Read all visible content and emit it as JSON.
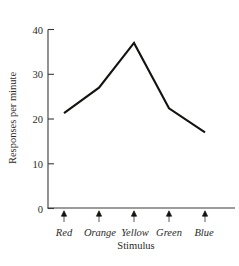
{
  "chart_data": {
    "type": "line",
    "title": "",
    "subtitle": "",
    "xlabel": "Stimulus",
    "ylabel": "Responses per minute",
    "categories": [
      "Red",
      "Orange",
      "Yellow",
      "Green",
      "Blue"
    ],
    "values": [
      21.3,
      27.0,
      37.0,
      22.4,
      17.0
    ],
    "series": [
      {
        "name": "Responses per minute",
        "values": [
          21.3,
          27.0,
          37.0,
          22.4,
          17.0
        ],
        "color": "#15130f"
      }
    ],
    "ylim": [
      0,
      40
    ],
    "yticks": [
      0,
      10,
      20,
      30,
      40
    ],
    "ytick_labels": [
      "0",
      "10",
      "20",
      "30",
      "40"
    ],
    "xtick_labels": [
      "Red",
      "Orange",
      "Yellow",
      "Green",
      "Blue"
    ],
    "grid": false,
    "legend": false,
    "legend_position": "none",
    "xtick_marker": "up-arrow",
    "annotations": []
  },
  "axes": {
    "y_label_text": "Responses per minute",
    "x_label_text": "Stimulus",
    "y_tick_0": "0",
    "y_tick_10": "10",
    "y_tick_20": "20",
    "y_tick_30": "30",
    "y_tick_40": "40"
  },
  "x_labels": {
    "c0": "Red",
    "c1": "Orange",
    "c2": "Yellow",
    "c3": "Green",
    "c4": "Blue"
  },
  "colors": {
    "line": "#15130f",
    "axis": "#3a3a3a",
    "text": "#2c2a28",
    "background": "#ffffff"
  }
}
